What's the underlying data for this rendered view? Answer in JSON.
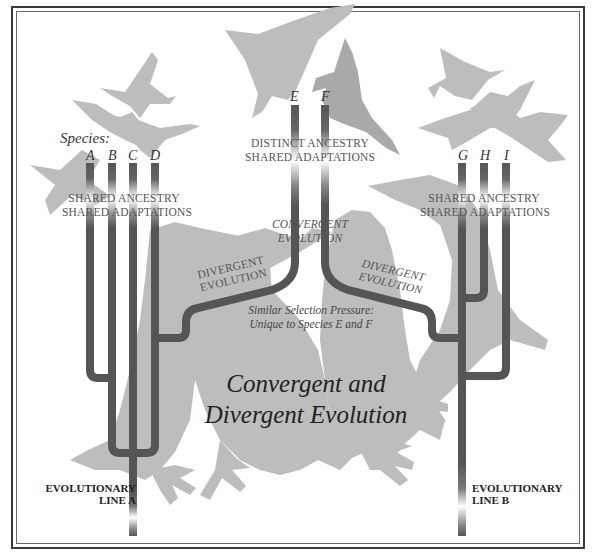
{
  "title": {
    "line1": "Convergent and",
    "line2": "Divergent Evolution"
  },
  "species_label": "Species:",
  "species": {
    "line_a": [
      "A",
      "B",
      "C",
      "D"
    ],
    "middle": [
      "E",
      "F"
    ],
    "line_b": [
      "G",
      "H",
      "I"
    ]
  },
  "group_labels": {
    "left": {
      "line1": "SHARED ANCESTRY",
      "line2": "SHARED ADAPTATIONS"
    },
    "middle": {
      "line1": "DISTINCT ANCESTRY",
      "line2": "SHARED ADAPTATIONS"
    },
    "right": {
      "line1": "SHARED ANCESTRY",
      "line2": "SHARED ADAPTATIONS"
    }
  },
  "process_labels": {
    "convergent": {
      "line1": "CONVERGENT",
      "line2": "EVOLUTION"
    },
    "divergent_left": {
      "line1": "DIVERGENT",
      "line2": "EVOLUTION"
    },
    "divergent_right": {
      "line1": "DIVERGENT",
      "line2": "EVOLUTION"
    }
  },
  "selection_note": {
    "line1": "Similar Selection Pressure:",
    "line2": "Unique to Species E and F"
  },
  "lineages": {
    "a": {
      "line1": "EVOLUTIONARY",
      "line2": "LINE A"
    },
    "b": {
      "line1": "EVOLUTIONARY",
      "line2": "LINE B"
    }
  },
  "colors": {
    "branch": "#555555",
    "silhouette": "#bdbdbd",
    "silhouette_dark": "#a9a9a9",
    "border": "#3a3a3a",
    "background": "#ffffff"
  }
}
